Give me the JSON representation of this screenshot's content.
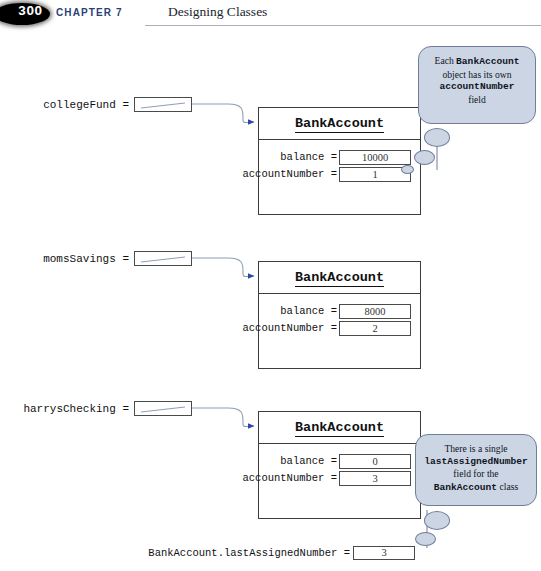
{
  "header": {
    "page_number": "300",
    "chapter_label": "CHAPTER 7",
    "chapter_title": "Designing Classes",
    "accent_color": "#2b3f78",
    "rule_color": "#aab0bb"
  },
  "diagram": {
    "object_title": "BankAccount",
    "colors": {
      "bubble_fill": "#ccd5e4",
      "bubble_stroke": "#6f7f99",
      "arrow": "#2b47a8",
      "wire": "#8f9db5",
      "box_stroke": "#3c3c3c"
    },
    "variables": [
      {
        "name": "collegeFund =",
        "ref_value": ""
      },
      {
        "name": "momsSavings =",
        "ref_value": ""
      },
      {
        "name": "harrysChecking =",
        "ref_value": ""
      }
    ],
    "objects": [
      {
        "title": "BankAccount",
        "fields": [
          {
            "label": "balance =",
            "value": "10000"
          },
          {
            "label": "accountNumber =",
            "value": "1"
          }
        ]
      },
      {
        "title": "BankAccount",
        "fields": [
          {
            "label": "balance =",
            "value": "8000"
          },
          {
            "label": "accountNumber =",
            "value": "2"
          }
        ]
      },
      {
        "title": "BankAccount",
        "fields": [
          {
            "label": "balance =",
            "value": "0"
          },
          {
            "label": "accountNumber =",
            "value": "3"
          }
        ]
      }
    ],
    "static_field": {
      "label": "BankAccount.lastAssignedNumber =",
      "value": "3"
    },
    "callouts": [
      {
        "id": "instance-field-callout",
        "line1_plain": "Each ",
        "line1_mono": "BankAccount",
        "line2_plain": "object has its own",
        "line3_mono": "accountNumber",
        "line4_plain": "field"
      },
      {
        "id": "static-field-callout",
        "line1_plain": "There is a single",
        "line2_mono": "lastAssignedNumber",
        "line3_plain": "field for the",
        "line4_mono": "BankAccount",
        "line4_plain": " class"
      }
    ]
  }
}
